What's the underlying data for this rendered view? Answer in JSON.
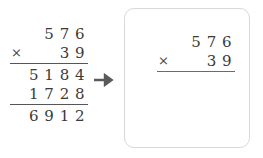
{
  "worked_example": {
    "multiplicand": "5 7 6",
    "operator": "×",
    "multiplier": "3 9",
    "partial_product_1": "5 1 8 4",
    "partial_product_2": "1 7 2 8",
    "sum": "6 9 1 2"
  },
  "arrow": {
    "glyph": "➜",
    "label": "leads to"
  },
  "panel": {
    "multiplicand": "5 7 6",
    "operator": "×",
    "multiplier": "3 9"
  },
  "colors": {
    "background": "#ffffff",
    "digit_text": "#3a3a3a",
    "rule": "#565656",
    "panel_border": "#d8d8d8",
    "arrow": "#5a5a5a"
  }
}
